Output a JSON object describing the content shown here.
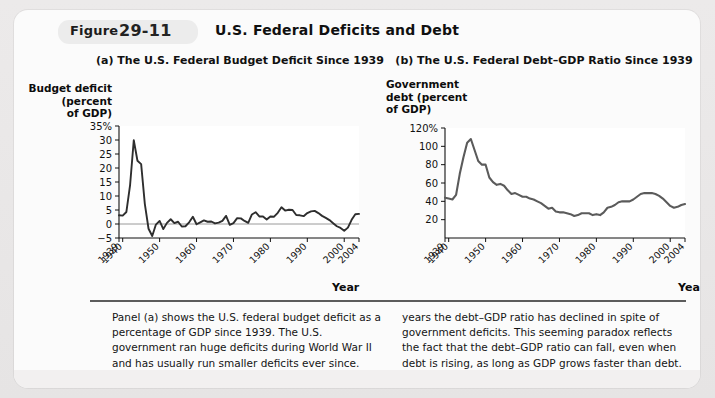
{
  "figure": {
    "label": "Figure",
    "number": "29-11",
    "title": "U.S. Federal Deficits and Debt"
  },
  "panels": {
    "a": {
      "title": "(a) The U.S. Federal Budget Deficit Since 1939",
      "ylabel": "Budget deficit\n(percent\nof GDP)",
      "xlabel": "Year"
    },
    "b": {
      "title": "(b) The U.S. Federal Debt–GDP Ratio Since 1939",
      "ylabel": "Government\ndebt (percent\nof GDP)",
      "xlabel": "Year"
    }
  },
  "caption": {
    "left": "Panel (a) shows the U.S. federal budget deficit as a percentage of GDP since 1939. The U.S. government ran huge deficits during World War II and has usually run smaller deficits ever since. Panel (b) shows the U.S. debt–GDP ratio. Comparing panels (a) and (b), you can see that in many",
    "right": "years the debt–GDP ratio has declined in spite of government deficits. This seeming paradox reflects the fact that the debt–GDP ratio can fall, even when debt is rising, as long as GDP grows faster than debt.",
    "source_prefix": "Source:",
    "source_text": "Economic Report of the President (2005)."
  },
  "colors": {
    "page_background": "#e8e8e8",
    "card_background": "#fbfbfb",
    "plot_background": "#ffffff",
    "series_deficit": "#2e2e2e",
    "series_debt": "#5b5b5b",
    "axis": "#111111",
    "divider": "#5c5c5c"
  },
  "chart_data": [
    {
      "type": "line",
      "panel": "a",
      "title": "(a) The U.S. Federal Budget Deficit Since 1939",
      "xlabel": "Year",
      "ylabel": "Budget deficit (percent of GDP)",
      "xlim": [
        1939,
        2004
      ],
      "ylim": [
        -5,
        35
      ],
      "yticks": [
        -5,
        0,
        5,
        10,
        15,
        20,
        25,
        30,
        35
      ],
      "yticklabels": [
        "−5",
        "0",
        "5",
        "10",
        "15",
        "20",
        "25",
        "30",
        "35%"
      ],
      "xticks": [
        1939,
        1940,
        1950,
        1960,
        1970,
        1980,
        1990,
        2000,
        2004
      ],
      "xticklabels": [
        "1939",
        "1940",
        "1950",
        "1960",
        "1970",
        "1980",
        "1990",
        "2000",
        "2004"
      ],
      "grid": false,
      "zero_line": true,
      "series": [
        {
          "name": "Budget deficit (percent of GDP)",
          "x": [
            1939,
            1940,
            1941,
            1942,
            1943,
            1944,
            1945,
            1946,
            1947,
            1948,
            1949,
            1950,
            1951,
            1952,
            1953,
            1954,
            1955,
            1956,
            1957,
            1958,
            1959,
            1960,
            1961,
            1962,
            1963,
            1964,
            1965,
            1966,
            1967,
            1968,
            1969,
            1970,
            1971,
            1972,
            1973,
            1974,
            1975,
            1976,
            1977,
            1978,
            1979,
            1980,
            1981,
            1982,
            1983,
            1984,
            1985,
            1986,
            1987,
            1988,
            1989,
            1990,
            1991,
            1992,
            1993,
            1994,
            1995,
            1996,
            1997,
            1998,
            1999,
            2000,
            2001,
            2002,
            2003,
            2004
          ],
          "values": [
            3.1,
            3.0,
            4.3,
            13.9,
            29.9,
            22.6,
            21.4,
            7.1,
            -1.7,
            -4.3,
            -0.2,
            1.1,
            -1.8,
            0.4,
            1.7,
            0.3,
            0.8,
            -0.9,
            -0.8,
            0.6,
            2.6,
            -0.1,
            0.6,
            1.3,
            0.8,
            0.9,
            0.2,
            0.5,
            1.1,
            2.9,
            -0.3,
            0.3,
            2.1,
            2.0,
            1.1,
            0.4,
            3.4,
            4.2,
            2.7,
            2.7,
            1.6,
            2.7,
            2.6,
            4.0,
            6.0,
            4.8,
            5.1,
            5.0,
            3.2,
            3.1,
            2.8,
            3.9,
            4.5,
            4.7,
            3.9,
            2.9,
            2.2,
            1.4,
            0.3,
            -0.8,
            -1.4,
            -2.4,
            -1.3,
            1.5,
            3.5,
            3.6
          ],
          "color": "#2e2e2e"
        }
      ]
    },
    {
      "type": "line",
      "panel": "b",
      "title": "(b) The U.S. Federal Debt–GDP Ratio Since 1939",
      "xlabel": "Year",
      "ylabel": "Government debt (percent of GDP)",
      "xlim": [
        1939,
        2004
      ],
      "ylim": [
        0,
        120
      ],
      "yticks": [
        20,
        40,
        60,
        80,
        100,
        120
      ],
      "yticklabels": [
        "20",
        "40",
        "60",
        "80",
        "100",
        "120%"
      ],
      "xticks": [
        1939,
        1940,
        1950,
        1960,
        1970,
        1980,
        1990,
        2000,
        2004
      ],
      "xticklabels": [
        "1939",
        "1940",
        "1950",
        "1960",
        "1970",
        "1980",
        "1990",
        "2000",
        "2004"
      ],
      "grid": false,
      "zero_line": false,
      "series": [
        {
          "name": "Federal debt as percent of GDP",
          "x": [
            1939,
            1940,
            1941,
            1942,
            1943,
            1944,
            1945,
            1946,
            1947,
            1948,
            1949,
            1950,
            1951,
            1952,
            1953,
            1954,
            1955,
            1956,
            1957,
            1958,
            1959,
            1960,
            1961,
            1962,
            1963,
            1964,
            1965,
            1966,
            1967,
            1968,
            1969,
            1970,
            1971,
            1972,
            1973,
            1974,
            1975,
            1976,
            1977,
            1978,
            1979,
            1980,
            1981,
            1982,
            1983,
            1984,
            1985,
            1986,
            1987,
            1988,
            1989,
            1990,
            1991,
            1992,
            1993,
            1994,
            1995,
            1996,
            1997,
            1998,
            1999,
            2000,
            2001,
            2002,
            2003,
            2004
          ],
          "values": [
            44,
            43,
            42,
            47,
            70,
            88,
            104,
            108,
            96,
            84,
            80,
            80,
            66,
            61,
            58,
            59,
            57,
            52,
            48,
            49,
            47,
            45,
            45,
            43,
            42,
            40,
            38,
            35,
            32,
            33,
            29,
            28,
            28,
            27,
            26,
            24,
            25,
            27,
            27,
            27,
            25,
            26,
            25,
            28,
            33,
            34,
            36,
            39,
            40,
            40,
            40,
            42,
            45,
            48,
            49,
            49,
            49,
            48,
            46,
            43,
            39,
            35,
            33,
            34,
            36,
            37
          ],
          "color": "#5b5b5b"
        }
      ]
    }
  ]
}
